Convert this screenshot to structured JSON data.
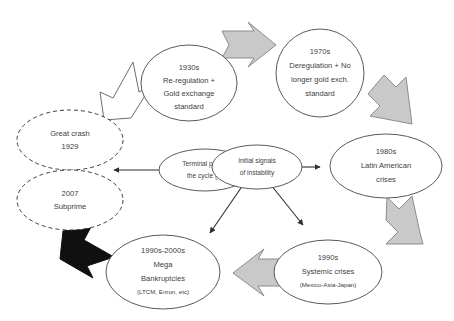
{
  "diagram": {
    "background_color": "#ffffff",
    "text_color": "#404040",
    "solid_outline_color": "#5a5a5a",
    "dashed_outline_color": "#3f3f3f",
    "gray_arrow_fill": "#c9c9c9",
    "gray_arrow_stroke": "#8c8c8c",
    "white_arrow_fill": "#ffffff",
    "black_arrow_fill": "#101010",
    "connector_color": "#2e2e2e"
  },
  "nodes": {
    "reregulation_1930s": {
      "name": "1930s re-regulation",
      "style": "solid-ellipse",
      "lines": [
        "1930s",
        "Re-regulation +",
        "Gold exchange",
        "standard"
      ]
    },
    "deregulation_1970s": {
      "name": "1970s deregulation",
      "style": "solid-ellipse",
      "lines": [
        "1970s",
        "Deregulation + No",
        "longer gold exch.",
        "standard"
      ]
    },
    "latin_american_1980s": {
      "name": "1980s Latin American crises",
      "style": "solid-ellipse",
      "lines": [
        "1980s",
        "Latin American",
        "crises"
      ]
    },
    "systemic_1990s": {
      "name": "1990s systemic crises",
      "style": "solid-ellipse",
      "lines": [
        "1990s",
        "Systemic crises",
        "(Mexico-Asia-Japan)"
      ]
    },
    "mega_bankruptcies": {
      "name": "1990s-2000s mega bankruptcies",
      "style": "solid-ellipse",
      "lines": [
        "1990s-2000s",
        "Mega",
        "Bankruptcies",
        "(LTCM, Enron, etc)"
      ]
    },
    "initial_signals": {
      "name": "Initial signals of instability",
      "style": "solid-ellipse",
      "lines": [
        "Initial signals",
        "of instability"
      ]
    },
    "terminal_part": {
      "name": "Terminal part of the cycle",
      "style": "solid-ellipse",
      "lines": [
        "Terminal part of",
        "the cycle (?)"
      ]
    },
    "great_crash_1929": {
      "name": "Great crash 1929",
      "style": "dashed-ellipse",
      "lines": [
        "Great crash",
        "1929"
      ]
    },
    "subprime_2007": {
      "name": "2007 Subprime",
      "style": "dashed-ellipse",
      "lines": [
        "2007",
        "Subprime"
      ]
    }
  },
  "arrows": {
    "white_up_right": {
      "name": "white bent arrow to 1930s",
      "color": "#ffffff",
      "direction": "up-right"
    },
    "gray_right_top": {
      "name": "gray arrow 1930s to 1970s",
      "color": "#c9c9c9",
      "direction": "right"
    },
    "gray_down_right": {
      "name": "gray arrow 1970s to 1980s",
      "color": "#c9c9c9",
      "direction": "down-right"
    },
    "gray_down_left": {
      "name": "gray arrow 1980s to 1990s",
      "color": "#c9c9c9",
      "direction": "down-left"
    },
    "gray_left_bottom": {
      "name": "gray arrow 1990s to mega bankruptcies",
      "color": "#c9c9c9",
      "direction": "left"
    },
    "black_up_left": {
      "name": "black arrow to subprime",
      "color": "#101010",
      "direction": "up-left"
    },
    "thin_to_latin": {
      "name": "connector initial signals to 1980s",
      "direction": "right"
    },
    "thin_to_mega": {
      "name": "connector initial signals to mega bankruptcies",
      "direction": "down-left"
    },
    "thin_to_systemic": {
      "name": "connector initial signals to 1990s",
      "direction": "down-right"
    },
    "thin_to_crash": {
      "name": "connector terminal part to great crash",
      "direction": "left"
    }
  }
}
